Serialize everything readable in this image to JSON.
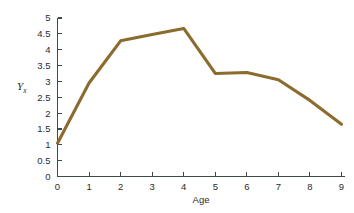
{
  "chart_data": {
    "type": "line",
    "title": "",
    "xlabel": "Age",
    "ylabel": "Yx",
    "ylabel_base": "Y",
    "ylabel_subscript": "x",
    "x": [
      0,
      1,
      2,
      3,
      4,
      5,
      6,
      7,
      8,
      9
    ],
    "values": [
      1.05,
      2.95,
      4.28,
      4.48,
      4.67,
      3.25,
      3.28,
      3.05,
      2.4,
      1.65
    ],
    "series": [
      {
        "name": "Yx",
        "values": [
          1.05,
          2.95,
          4.28,
          4.48,
          4.67,
          3.25,
          3.28,
          3.05,
          2.4,
          1.65
        ]
      }
    ],
    "xlim": [
      0,
      9
    ],
    "ylim": [
      0,
      5
    ],
    "xticks": [
      "0",
      "1",
      "2",
      "3",
      "4",
      "5",
      "6",
      "7",
      "8",
      "9"
    ],
    "yticks": [
      "0",
      "0.5",
      "1",
      "1.5",
      "2",
      "2.5",
      "3",
      "3.5",
      "4",
      "4.5",
      "5"
    ],
    "xtick_values": [
      0,
      1,
      2,
      3,
      4,
      5,
      6,
      7,
      8,
      9
    ],
    "ytick_values": [
      0,
      0.5,
      1,
      1.5,
      2,
      2.5,
      3,
      3.5,
      4,
      4.5,
      5
    ],
    "grid": false,
    "legend": false,
    "legend_position": "none",
    "line_color": "#8b6b2e",
    "axis_color": "#3c4a4a",
    "text_color": "#2b2b2b",
    "background_color": "#ffffff"
  }
}
